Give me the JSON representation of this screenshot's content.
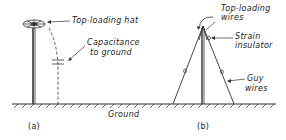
{
  "figure_a": {
    "label": "(a)",
    "annotations": {
      "hat": "Top-loading hat",
      "capacitance_line1": "Capacitance",
      "capacitance_line2": "to ground"
    }
  },
  "figure_b": {
    "label": "(b)",
    "annotations": {
      "wires_line1": "Top-loading",
      "wires_line2": "wires",
      "insulator_line1": "Strain",
      "insulator_line2": "insulator",
      "guy_line1": "Guy",
      "guy_line2": "wires"
    }
  },
  "ground_label": "Ground",
  "colors": {
    "ink": "#333333",
    "background": "#ffffff"
  }
}
